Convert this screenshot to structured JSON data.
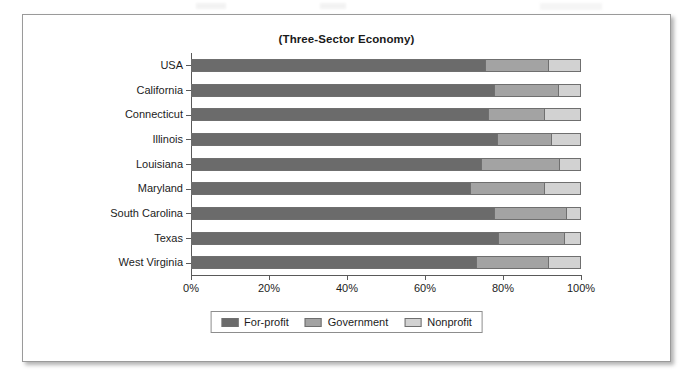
{
  "chart_data": {
    "type": "bar",
    "subtype": "stacked-horizontal-bar-100pct",
    "title": "(Three-Sector Economy)",
    "xlabel": "",
    "ylabel": "",
    "xlim": [
      0,
      100
    ],
    "xticks": [
      0,
      20,
      40,
      60,
      80,
      100
    ],
    "xticklabels": [
      "0%",
      "20%",
      "40%",
      "60%",
      "80%",
      "100%"
    ],
    "grid": false,
    "legend_position": "bottom-center",
    "categories": [
      "USA",
      "California",
      "Connecticut",
      "Illinois",
      "Louisiana",
      "Maryland",
      "South Carolina",
      "Texas",
      "West Virginia"
    ],
    "series": [
      {
        "name": "For-profit",
        "color": "#6b6b6b",
        "values": [
          75.4,
          77.7,
          76.1,
          78.5,
          74.4,
          71.6,
          77.7,
          78.7,
          73.1
        ]
      },
      {
        "name": "Government",
        "color": "#a3a3a3",
        "values": [
          16.1,
          16.4,
          14.4,
          13.8,
          20.0,
          18.9,
          18.5,
          16.9,
          18.4
        ]
      },
      {
        "name": "Nonprofit",
        "color": "#d2d2d2",
        "values": [
          8.5,
          5.9,
          9.5,
          7.7,
          5.6,
          9.5,
          3.8,
          4.4,
          8.5
        ]
      }
    ]
  },
  "legend": {
    "items": [
      {
        "label": "For-profit",
        "color": "#6b6b6b"
      },
      {
        "label": "Government",
        "color": "#a3a3a3"
      },
      {
        "label": "Nonprofit",
        "color": "#d2d2d2"
      }
    ]
  }
}
